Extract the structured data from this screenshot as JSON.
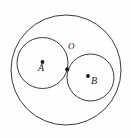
{
  "figure": {
    "background_color": "#fefefe",
    "stroke_color": "#3a3a3a",
    "dot_color": "#1a1a1a",
    "canvas": {
      "width": 131,
      "height": 138
    }
  },
  "labels": {
    "center_a": "A",
    "center_b": "B",
    "tangent_point": "O"
  },
  "chart_data": {
    "type": "diagram",
    "shapes": [
      {
        "name": "outer-circle",
        "kind": "circle",
        "cx": 66,
        "cy": 70,
        "r": 55,
        "stroke": "#3a3a3a",
        "fill": "none"
      },
      {
        "name": "circle-a",
        "kind": "circle",
        "cx": 42.5,
        "cy": 63,
        "r": 25.5,
        "stroke": "#3a3a3a",
        "fill": "none"
      },
      {
        "name": "circle-b",
        "kind": "circle",
        "cx": 90.5,
        "cy": 77.5,
        "r": 23.5,
        "stroke": "#3a3a3a",
        "fill": "none"
      }
    ],
    "points": [
      {
        "name": "center-a",
        "label": "A",
        "x": 42.5,
        "y": 62,
        "label_x": 42,
        "label_y": 72
      },
      {
        "name": "center-b",
        "label": "B",
        "x": 88,
        "y": 76,
        "label_x": 95,
        "label_y": 85
      },
      {
        "name": "tangent-point-o",
        "label": "O",
        "x": 67.2,
        "y": 69.3,
        "label_x": 72,
        "label_y": 51
      }
    ]
  }
}
